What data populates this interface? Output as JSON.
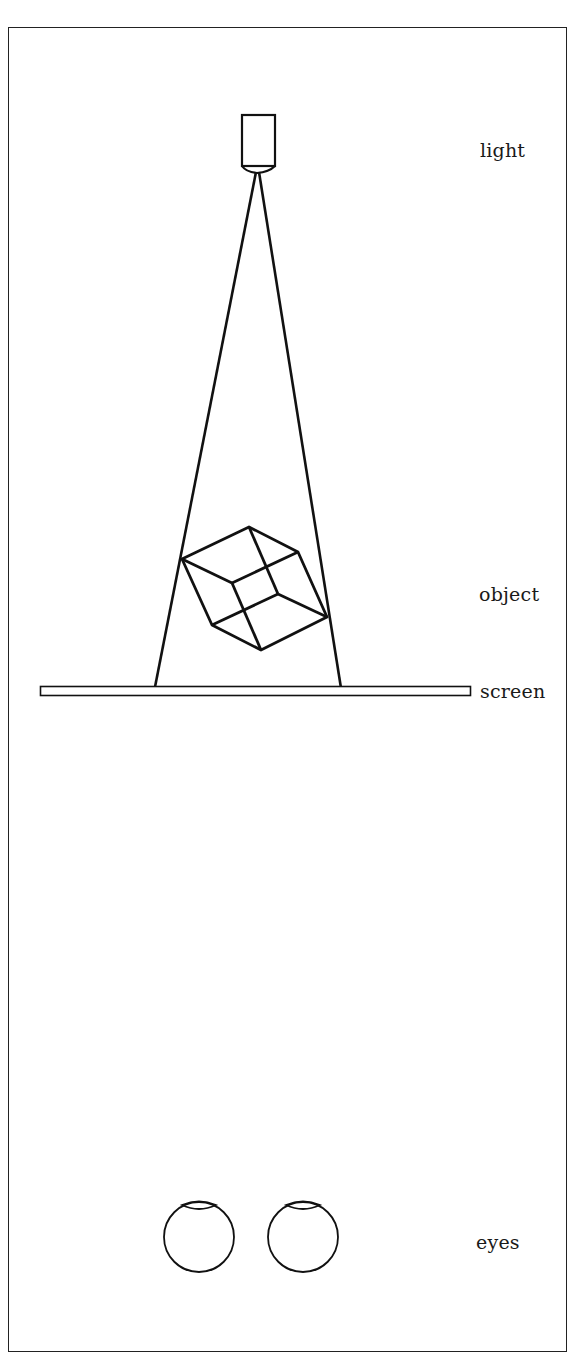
{
  "diagram": {
    "labels": {
      "light": "light",
      "object": "object",
      "screen": "screen",
      "eyes": "eyes"
    },
    "colors": {
      "stroke": "#111111",
      "background": "#ffffff"
    },
    "elements": [
      "light-source",
      "light-rays",
      "cube-object",
      "projection-screen",
      "left-eye",
      "right-eye"
    ]
  }
}
